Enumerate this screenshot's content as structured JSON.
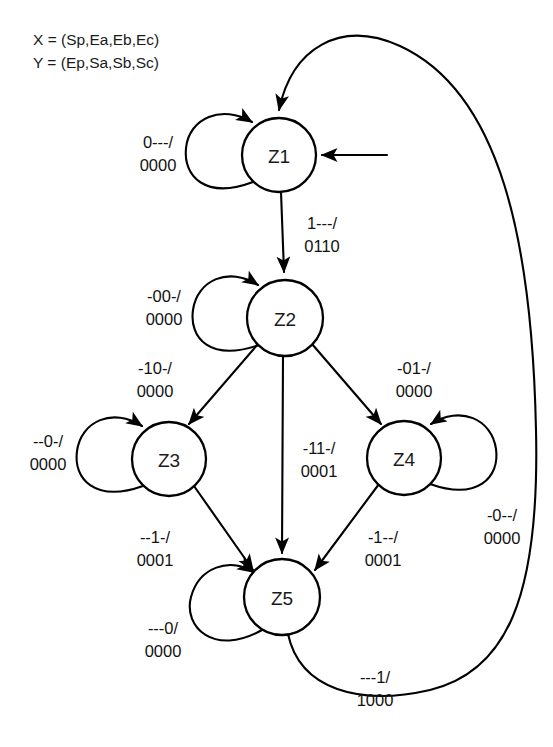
{
  "legend": {
    "line1": "X = (Sp,Ea,Eb,Ec)",
    "line2": "Y = (Ep,Sa,Sb,Sc)"
  },
  "states": [
    {
      "id": "Z1",
      "label": "Z1",
      "cx": 279,
      "cy": 155,
      "r": 37
    },
    {
      "id": "Z2",
      "label": "Z2",
      "cx": 285,
      "cy": 318,
      "r": 38
    },
    {
      "id": "Z3",
      "label": "Z3",
      "cx": 169,
      "cy": 459,
      "r": 37
    },
    {
      "id": "Z4",
      "label": "Z4",
      "cx": 404,
      "cy": 458,
      "r": 37
    },
    {
      "id": "Z5",
      "label": "Z5",
      "cx": 282,
      "cy": 597,
      "r": 38
    }
  ],
  "transitions": [
    {
      "id": "z1-self",
      "from": "Z1",
      "to": "Z1",
      "kind": "self-loop",
      "input": "0---/",
      "output": "0000",
      "label_x": 158,
      "label_y": 148
    },
    {
      "id": "z1-to-z2",
      "from": "Z1",
      "to": "Z2",
      "kind": "straight",
      "input": "1---/",
      "output": "0110",
      "label_x": 322,
      "label_y": 229
    },
    {
      "id": "z2-self",
      "from": "Z2",
      "to": "Z2",
      "kind": "self-loop",
      "input": "-00-/",
      "output": "0000",
      "label_x": 164,
      "label_y": 302
    },
    {
      "id": "z2-to-z3",
      "from": "Z2",
      "to": "Z3",
      "kind": "straight",
      "input": "-10-/",
      "output": "0000",
      "label_x": 155,
      "label_y": 374
    },
    {
      "id": "z2-to-z5",
      "from": "Z2",
      "to": "Z5",
      "kind": "straight",
      "input": "-11-/",
      "output": "0001",
      "label_x": 319,
      "label_y": 454
    },
    {
      "id": "z2-to-z4",
      "from": "Z2",
      "to": "Z4",
      "kind": "straight",
      "input": "-01-/",
      "output": "0000",
      "label_x": 414,
      "label_y": 374
    },
    {
      "id": "z3-self",
      "from": "Z3",
      "to": "Z3",
      "kind": "self-loop",
      "input": "--0-/",
      "output": "0000",
      "label_x": 48,
      "label_y": 447
    },
    {
      "id": "z3-to-z5",
      "from": "Z3",
      "to": "Z5",
      "kind": "straight",
      "input": "--1-/",
      "output": "0001",
      "label_x": 155,
      "label_y": 543
    },
    {
      "id": "z4-self",
      "from": "Z4",
      "to": "Z4",
      "kind": "self-loop",
      "input": "-0--/",
      "output": "0000",
      "label_x": 502,
      "label_y": 521
    },
    {
      "id": "z4-to-z5",
      "from": "Z4",
      "to": "Z5",
      "kind": "straight",
      "input": "-1--/",
      "output": "0001",
      "label_x": 383,
      "label_y": 543
    },
    {
      "id": "z5-self",
      "from": "Z5",
      "to": "Z5",
      "kind": "self-loop",
      "input": "---0/",
      "output": "0000",
      "label_x": 163,
      "label_y": 634
    },
    {
      "id": "z5-to-z1",
      "from": "Z5",
      "to": "Z1",
      "kind": "feedback-arc",
      "input": "---1/",
      "output": "1000",
      "label_x": 375,
      "label_y": 683
    }
  ],
  "start_marker": {
    "name": "initial-state-arrow",
    "target": "Z1"
  },
  "colors": {
    "stroke": "#000000",
    "fill": "#ffffff",
    "text": "#1a1a1a"
  }
}
